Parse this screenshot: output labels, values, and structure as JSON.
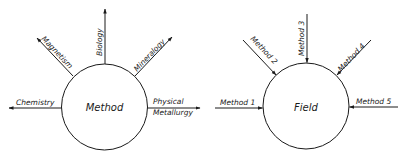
{
  "diagrams": [
    {
      "id": "method-diagram",
      "center_label": "Method",
      "arrow_direction": "outward",
      "branches": [
        {
          "label": "Chemistry",
          "direction": "left"
        },
        {
          "label": "Magnetism",
          "direction": "upper-left"
        },
        {
          "label": "Biology",
          "direction": "up"
        },
        {
          "label": "Mineralogy",
          "direction": "upper-right"
        },
        {
          "label_line1": "Physical",
          "label_line2": "Metallurgy",
          "direction": "right"
        }
      ]
    },
    {
      "id": "field-diagram",
      "center_label": "Field",
      "arrow_direction": "inward",
      "branches": [
        {
          "label": "Method 1",
          "direction": "left"
        },
        {
          "label": "Method 2",
          "direction": "upper-left"
        },
        {
          "label": "Method 3",
          "direction": "up"
        },
        {
          "label": "Method 4",
          "direction": "upper-right"
        },
        {
          "label": "Method 5",
          "direction": "right"
        }
      ]
    }
  ],
  "colors": {
    "line": "#1a1a1a",
    "background": "#ffffff"
  }
}
